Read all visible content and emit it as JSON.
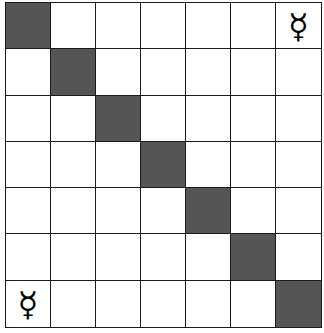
{
  "board": {
    "rows": 7,
    "cols": 7,
    "colors": {
      "light": "#ffffff",
      "dark": "#555555",
      "grid_line": "#1a1a1a",
      "piece": "#000000"
    },
    "dark_cells": [
      [
        0,
        0
      ],
      [
        1,
        1
      ],
      [
        2,
        2
      ],
      [
        3,
        3
      ],
      [
        4,
        4
      ],
      [
        5,
        5
      ],
      [
        6,
        6
      ]
    ],
    "pieces": [
      {
        "row": 0,
        "col": 6,
        "symbol": "☿",
        "name": "mercury-symbol"
      },
      {
        "row": 6,
        "col": 0,
        "symbol": "☿",
        "name": "mercury-symbol"
      }
    ]
  }
}
